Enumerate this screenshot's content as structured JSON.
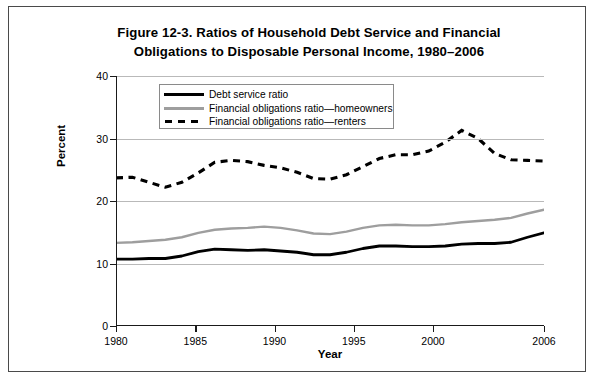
{
  "figure": {
    "title": "Figure 12-3. Ratios of Household Debt Service and Financial Obligations to Disposable Personal Income, 1980–2006",
    "title_line1": "Figure 12-3. Ratios of Household Debt Service and Financial",
    "title_line2": "Obligations to Disposable Personal Income, 1980–2006"
  },
  "axes": {
    "xlabel": "Year",
    "ylabel": "Percent",
    "ytick_labels": [
      "0",
      "10",
      "20",
      "30",
      "40"
    ],
    "xtick_labels": [
      "1980",
      "1985",
      "1990",
      "1995",
      "2000",
      "2006"
    ]
  },
  "legend": {
    "items": [
      {
        "label": "Debt service ratio",
        "key": "solid-black-line",
        "color": "#000000"
      },
      {
        "label": "Financial obligations ratio—homeowners",
        "key": "solid-gray-line",
        "color": "#9e9e9e"
      },
      {
        "label": "Financial obligations ratio—renters",
        "key": "dashed-black-line",
        "color": "#000000"
      }
    ]
  },
  "chart_data": {
    "type": "line",
    "title": "Figure 12-3. Ratios of Household Debt Service and Financial Obligations to Disposable Personal Income, 1980–2006",
    "xlabel": "Year",
    "ylabel": "Percent",
    "xlim": [
      1980,
      2006
    ],
    "ylim": [
      0,
      40
    ],
    "yticks": [
      0,
      10,
      20,
      30,
      40
    ],
    "xticks": [
      1980,
      1985,
      1990,
      1995,
      2000,
      2006
    ],
    "grid": "horizontal",
    "legend_position": "upper-left-inside",
    "x": [
      1980,
      1981,
      1982,
      1983,
      1984,
      1985,
      1986,
      1987,
      1988,
      1989,
      1990,
      1991,
      1992,
      1993,
      1994,
      1995,
      1996,
      1997,
      1998,
      1999,
      2000,
      2001,
      2002,
      2003,
      2004,
      2005,
      2006
    ],
    "series": [
      {
        "name": "Debt service ratio",
        "color": "#000000",
        "style": "solid",
        "values": [
          10.7,
          10.7,
          10.8,
          10.8,
          11.2,
          11.9,
          12.3,
          12.2,
          12.1,
          12.2,
          12.0,
          11.8,
          11.4,
          11.4,
          11.8,
          12.4,
          12.8,
          12.8,
          12.7,
          12.7,
          12.8,
          13.1,
          13.2,
          13.2,
          13.4,
          14.2,
          14.9
        ]
      },
      {
        "name": "Financial obligations ratio—homeowners",
        "color": "#9e9e9e",
        "style": "solid",
        "values": [
          13.3,
          13.4,
          13.6,
          13.8,
          14.2,
          14.9,
          15.4,
          15.6,
          15.7,
          15.9,
          15.7,
          15.3,
          14.8,
          14.7,
          15.1,
          15.7,
          16.1,
          16.2,
          16.1,
          16.1,
          16.3,
          16.6,
          16.8,
          17.0,
          17.3,
          18.0,
          18.6
        ]
      },
      {
        "name": "Financial obligations ratio—renters",
        "color": "#000000",
        "style": "dashed",
        "values": [
          23.7,
          23.8,
          23.0,
          22.2,
          23.0,
          24.5,
          26.2,
          26.5,
          26.3,
          25.7,
          25.3,
          24.6,
          23.6,
          23.5,
          24.2,
          25.5,
          26.8,
          27.4,
          27.4,
          28.0,
          29.4,
          31.3,
          30.0,
          27.6,
          26.6,
          26.5,
          26.4
        ]
      }
    ]
  }
}
